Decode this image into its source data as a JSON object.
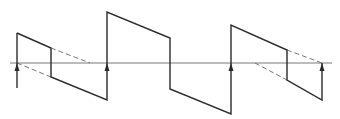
{
  "diagram": {
    "type": "sawtooth-waveform",
    "colors": {
      "line": "#2a2a2a",
      "baseline": "#555555",
      "dashed": "#666666",
      "background": "#ffffff"
    },
    "baseline": {
      "y": 63,
      "x1": 10,
      "x2": 332
    },
    "solid_path": [
      [
        17,
        33
      ],
      [
        51,
        48
      ],
      [
        51,
        77
      ],
      [
        107,
        100
      ],
      [
        107,
        12
      ],
      [
        170,
        38
      ],
      [
        170,
        89
      ],
      [
        231,
        114
      ],
      [
        231,
        25
      ],
      [
        287,
        50
      ],
      [
        287,
        80
      ],
      [
        322,
        100
      ],
      [
        322,
        63
      ]
    ],
    "initial_vertical": {
      "x": 17,
      "y1": 33,
      "y2": 88
    },
    "dashed_segments": [
      [
        [
          51,
          48
        ],
        [
          90,
          63
        ]
      ],
      [
        [
          17,
          63
        ],
        [
          51,
          77
        ]
      ],
      [
        [
          287,
          50
        ],
        [
          322,
          63
        ]
      ],
      [
        [
          255,
          63
        ],
        [
          287,
          80
        ]
      ]
    ],
    "arrows": [
      {
        "x": 17,
        "y": 63
      },
      {
        "x": 107,
        "y": 63
      },
      {
        "x": 231,
        "y": 63
      },
      {
        "x": 322,
        "y": 63
      }
    ]
  }
}
